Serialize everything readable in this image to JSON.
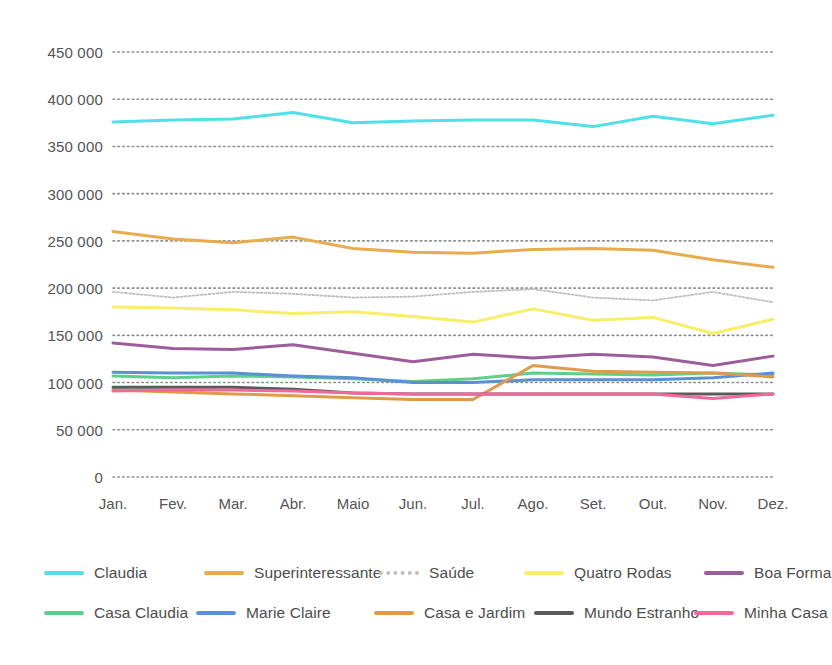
{
  "chart_data": {
    "type": "line",
    "title": "",
    "xlabel": "",
    "ylabel": "",
    "categories": [
      "Jan.",
      "Fev.",
      "Mar.",
      "Abr.",
      "Maio",
      "Jun.",
      "Jul.",
      "Ago.",
      "Set.",
      "Out.",
      "Nov.",
      "Dez."
    ],
    "ylim": [
      0,
      450000
    ],
    "ytick_values": [
      450000,
      400000,
      350000,
      300000,
      250000,
      200000,
      150000,
      100000,
      50000,
      0
    ],
    "ytick_labels": [
      "450 000",
      "400 000",
      "350 000",
      "300 000",
      "250 000",
      "200 000",
      "150 000",
      "100 000",
      "50 000",
      "0"
    ],
    "grid": "horizontal-dotted",
    "legend_position": "bottom",
    "series": [
      {
        "name": "Claudia",
        "color": "#4FE0E8",
        "style": "solid",
        "values": [
          376000,
          378000,
          379000,
          386000,
          375000,
          377000,
          378000,
          378000,
          371000,
          382000,
          374000,
          383000
        ]
      },
      {
        "name": "Superinteressante",
        "color": "#E8AC4E",
        "style": "solid",
        "values": [
          260000,
          252000,
          248000,
          254000,
          242000,
          238000,
          237000,
          241000,
          242000,
          240000,
          230000,
          222000
        ]
      },
      {
        "name": "Saúde",
        "color": "#BFBFBF",
        "style": "dotted",
        "values": [
          196000,
          190000,
          196000,
          194000,
          190000,
          191000,
          196000,
          199000,
          190000,
          187000,
          196000,
          185000
        ]
      },
      {
        "name": "Quatro Rodas",
        "color": "#F7EE6A",
        "style": "solid",
        "values": [
          180000,
          179000,
          177000,
          173000,
          175000,
          170000,
          164000,
          178000,
          166000,
          169000,
          152000,
          167000
        ]
      },
      {
        "name": "Boa Forma",
        "color": "#9C5D9C",
        "style": "solid",
        "values": [
          142000,
          136000,
          135000,
          140000,
          131000,
          122000,
          130000,
          126000,
          130000,
          127000,
          118000,
          128000
        ]
      },
      {
        "name": "Casa Claudia",
        "color": "#5DD08A",
        "style": "solid",
        "values": [
          107000,
          105000,
          107000,
          106000,
          104000,
          101000,
          104000,
          110000,
          109000,
          108000,
          110000,
          108000
        ]
      },
      {
        "name": "Marie Claire",
        "color": "#5B8FD6",
        "style": "solid",
        "values": [
          111000,
          110000,
          110000,
          107000,
          105000,
          100000,
          100000,
          103000,
          103000,
          103000,
          105000,
          110000
        ]
      },
      {
        "name": "Casa e Jardim",
        "color": "#E09A4A",
        "style": "solid",
        "values": [
          92000,
          90000,
          88000,
          86000,
          84000,
          82000,
          82000,
          118000,
          112000,
          111000,
          110000,
          106000
        ]
      },
      {
        "name": "Mundo Estranho",
        "color": "#5A5A5A",
        "style": "solid",
        "values": [
          95000,
          95000,
          95000,
          93000,
          89000,
          88000,
          88000,
          88000,
          88000,
          88000,
          88000,
          88000
        ]
      },
      {
        "name": "Minha Casa",
        "color": "#F2689B",
        "style": "solid",
        "values": [
          91000,
          92000,
          92000,
          91000,
          89000,
          88000,
          88000,
          88000,
          88000,
          88000,
          83000,
          88000
        ]
      }
    ]
  },
  "legend": {
    "rows": [
      [
        "Claudia",
        "Superinteressante",
        "Saúde",
        "Quatro Rodas",
        "Boa Forma"
      ],
      [
        "Casa Claudia",
        "Marie Claire",
        "Casa e Jardim",
        "Mundo Estranho",
        "Minha Casa"
      ]
    ]
  }
}
